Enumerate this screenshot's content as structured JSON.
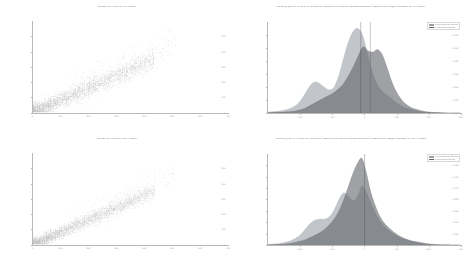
{
  "figure": {
    "background": "#ffffff",
    "rows": 2,
    "cols": 2
  },
  "colors": {
    "scatter_point": "#1a1a1a",
    "density_a_fill": "#9aa0a6",
    "density_b_fill": "#5f6368",
    "vline_a": "#3c4043",
    "vline_b": "#5a5f66",
    "axis": "#b9b9b9",
    "title_text": "#6e6e6e",
    "tick_text": "#9a9a9a"
  },
  "panels": [
    {
      "id": "scatter-lin",
      "title": "Actual vs Fitted on lin model",
      "type": "scatter",
      "position": "top-left"
    },
    {
      "id": "density-lin",
      "title": "Density plot of errors for sensitive features vs counterfactual sensitive features on target variable on lin model",
      "type": "area",
      "position": "top-right"
    },
    {
      "id": "scatter-xct",
      "title": "Actual vs Fitted on XCT model",
      "type": "scatter",
      "position": "bottom-left"
    },
    {
      "id": "density-xct",
      "title": "Density plot of errors for sensitive features vs counterfactual sensitive features on target variable on XCT model",
      "type": "area",
      "position": "bottom-right"
    }
  ],
  "legend_labels": {
    "sensitive": "errors sensitive features",
    "counterfactual": "errors counterfactual"
  },
  "chart_data": [
    {
      "type": "scatter",
      "id": "scatter-lin",
      "title": "Actual vs Fitted on lin model",
      "xlabel": "",
      "ylabel": "",
      "xlim": [
        0,
        700
      ],
      "ylim": [
        0,
        600
      ],
      "xticks": [
        0,
        100,
        200,
        300,
        400,
        500,
        600,
        700
      ],
      "xticklabels": [
        "0",
        "100",
        "200",
        "300",
        "400",
        "500",
        "600",
        "700"
      ],
      "yticks": [
        0,
        100,
        200,
        300,
        400,
        500
      ],
      "yticklabels": [
        "0",
        "100",
        "200",
        "300",
        "400",
        "500"
      ],
      "grid": false,
      "marker_color": "#1a1a1a",
      "marker_alpha": 0.25,
      "n_points": 4000,
      "cluster_description": "dense diagonal band rising from lower-left, widening toward the middle with a sparse upper tail",
      "points_sample": [
        [
          25,
          40
        ],
        [
          30,
          55
        ],
        [
          38,
          62
        ],
        [
          45,
          70
        ],
        [
          52,
          80
        ],
        [
          60,
          88
        ],
        [
          70,
          96
        ],
        [
          80,
          104
        ],
        [
          92,
          112
        ],
        [
          104,
          120
        ],
        [
          118,
          130
        ],
        [
          130,
          140
        ],
        [
          145,
          150
        ],
        [
          160,
          162
        ],
        [
          175,
          172
        ],
        [
          190,
          184
        ],
        [
          205,
          196
        ],
        [
          220,
          206
        ],
        [
          236,
          218
        ],
        [
          250,
          228
        ],
        [
          266,
          240
        ],
        [
          280,
          250
        ],
        [
          296,
          262
        ],
        [
          310,
          272
        ],
        [
          325,
          284
        ],
        [
          340,
          294
        ],
        [
          356,
          306
        ],
        [
          370,
          316
        ],
        [
          386,
          328
        ],
        [
          400,
          338
        ]
      ]
    },
    {
      "type": "area",
      "id": "density-lin",
      "title": "Density plot of errors for sensitive features vs counterfactual sensitive features on target variable on lin model",
      "xlabel": "",
      "ylabel": "Density",
      "xlim": [
        -300,
        300
      ],
      "ylim": [
        0,
        0.014
      ],
      "xticks": [
        -200,
        -100,
        0,
        100,
        200,
        300
      ],
      "xticklabels": [
        "-200",
        "-100",
        "0",
        "100",
        "200",
        "300"
      ],
      "yticks": [
        0,
        0.002,
        0.004,
        0.006,
        0.008,
        0.01,
        0.012
      ],
      "yticklabels": [
        "0.000",
        "0.002",
        "0.004",
        "0.006",
        "0.008",
        "0.010",
        "0.012"
      ],
      "grid": false,
      "vlines": [
        -12,
        18
      ],
      "series": [
        {
          "name": "errors sensitive features",
          "color": "#9aa0a6",
          "alpha": 0.6,
          "x": [
            -300,
            -260,
            -230,
            -205,
            -185,
            -170,
            -155,
            -140,
            -125,
            -110,
            -95,
            -80,
            -65,
            -50,
            -35,
            -20,
            -5,
            10,
            25,
            40,
            55,
            70,
            85,
            100,
            120,
            145,
            170,
            200,
            240,
            300
          ],
          "y": [
            0.0002,
            0.0004,
            0.0008,
            0.0016,
            0.003,
            0.0042,
            0.0048,
            0.0046,
            0.004,
            0.0036,
            0.004,
            0.0058,
            0.0085,
            0.011,
            0.0126,
            0.013,
            0.0118,
            0.009,
            0.0062,
            0.0044,
            0.0034,
            0.0028,
            0.0022,
            0.0016,
            0.001,
            0.0006,
            0.0003,
            0.0002,
            0.0001,
            5e-05
          ]
        },
        {
          "name": "errors counterfactual",
          "color": "#5f6368",
          "alpha": 0.6,
          "x": [
            -300,
            -260,
            -230,
            -205,
            -185,
            -170,
            -155,
            -140,
            -125,
            -110,
            -95,
            -80,
            -65,
            -50,
            -35,
            -20,
            -5,
            10,
            25,
            40,
            55,
            70,
            85,
            100,
            120,
            145,
            170,
            200,
            240,
            300
          ],
          "y": [
            0.0001,
            0.0002,
            0.0003,
            0.0005,
            0.0008,
            0.0012,
            0.0016,
            0.002,
            0.0024,
            0.0028,
            0.0032,
            0.0038,
            0.0046,
            0.0058,
            0.0072,
            0.0088,
            0.0102,
            0.0096,
            0.0094,
            0.0098,
            0.009,
            0.007,
            0.0048,
            0.0032,
            0.0018,
            0.0009,
            0.0005,
            0.0002,
            0.0001,
            5e-05
          ]
        }
      ]
    },
    {
      "type": "scatter",
      "id": "scatter-xct",
      "title": "Actual vs Fitted on XCT model",
      "xlabel": "",
      "ylabel": "",
      "xlim": [
        0,
        700
      ],
      "ylim": [
        0,
        600
      ],
      "xticks": [
        0,
        100,
        200,
        300,
        400,
        500,
        600,
        700
      ],
      "xticklabels": [
        "0",
        "100",
        "200",
        "300",
        "400",
        "500",
        "600",
        "700"
      ],
      "yticks": [
        0,
        100,
        200,
        300,
        400,
        500
      ],
      "yticklabels": [
        "0",
        "100",
        "200",
        "300",
        "400",
        "500"
      ],
      "grid": false,
      "marker_color": "#1a1a1a",
      "marker_alpha": 0.25,
      "n_points": 4000,
      "cluster_description": "dense diagonal band rising from lower-left, more compact than the lin model with a short upper tail",
      "points_sample": [
        [
          22,
          35
        ],
        [
          30,
          48
        ],
        [
          40,
          58
        ],
        [
          50,
          66
        ],
        [
          60,
          76
        ],
        [
          72,
          84
        ],
        [
          84,
          94
        ],
        [
          96,
          102
        ],
        [
          110,
          112
        ],
        [
          124,
          120
        ],
        [
          138,
          130
        ],
        [
          152,
          140
        ],
        [
          168,
          148
        ],
        [
          182,
          158
        ],
        [
          198,
          168
        ],
        [
          212,
          176
        ],
        [
          228,
          186
        ],
        [
          242,
          194
        ],
        [
          258,
          204
        ],
        [
          272,
          212
        ],
        [
          288,
          222
        ],
        [
          302,
          230
        ],
        [
          316,
          238
        ],
        [
          330,
          248
        ],
        [
          344,
          256
        ]
      ]
    },
    {
      "type": "area",
      "id": "density-xct",
      "title": "Density plot of errors for sensitive features vs counterfactual sensitive features on target variable on XCT model",
      "xlabel": "",
      "ylabel": "Density",
      "xlim": [
        -300,
        300
      ],
      "ylim": [
        0,
        0.016
      ],
      "xticks": [
        -200,
        -100,
        0,
        100,
        200,
        300
      ],
      "xticklabels": [
        "-200",
        "-100",
        "0",
        "100",
        "200",
        "300"
      ],
      "yticks": [
        0,
        0.002,
        0.004,
        0.006,
        0.008,
        0.01,
        0.012,
        0.014
      ],
      "yticklabels": [
        "0.000",
        "0.002",
        "0.004",
        "0.006",
        "0.008",
        "0.010",
        "0.012",
        "0.014"
      ],
      "grid": false,
      "vlines": [
        0
      ],
      "series": [
        {
          "name": "errors sensitive features",
          "color": "#9aa0a6",
          "alpha": 0.6,
          "x": [
            -300,
            -260,
            -230,
            -205,
            -185,
            -170,
            -155,
            -140,
            -125,
            -110,
            -95,
            -80,
            -65,
            -50,
            -35,
            -20,
            -8,
            5,
            20,
            40,
            60,
            85,
            110,
            140,
            175,
            210,
            250,
            300
          ],
          "y": [
            0.0002,
            0.0004,
            0.0008,
            0.0016,
            0.0028,
            0.0038,
            0.0044,
            0.0046,
            0.0046,
            0.005,
            0.0062,
            0.008,
            0.0092,
            0.0086,
            0.0078,
            0.0088,
            0.0104,
            0.0094,
            0.0074,
            0.005,
            0.0034,
            0.0022,
            0.0014,
            0.0008,
            0.0004,
            0.0002,
            0.0001,
            5e-05
          ]
        },
        {
          "name": "errors counterfactual",
          "color": "#5f6368",
          "alpha": 0.6,
          "x": [
            -300,
            -260,
            -230,
            -205,
            -185,
            -170,
            -155,
            -140,
            -125,
            -110,
            -95,
            -80,
            -65,
            -50,
            -35,
            -20,
            -8,
            5,
            20,
            40,
            60,
            85,
            110,
            140,
            175,
            210,
            250,
            300
          ],
          "y": [
            0.0001,
            0.0002,
            0.0004,
            0.0007,
            0.001,
            0.0014,
            0.0018,
            0.0022,
            0.0028,
            0.0036,
            0.0046,
            0.006,
            0.008,
            0.0104,
            0.0128,
            0.0146,
            0.0152,
            0.0128,
            0.0092,
            0.006,
            0.004,
            0.0026,
            0.0016,
            0.0009,
            0.0005,
            0.0002,
            0.0001,
            5e-05
          ]
        }
      ]
    }
  ]
}
